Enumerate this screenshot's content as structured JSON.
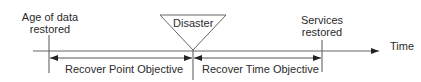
{
  "diagram": {
    "labels": {
      "age_of_data_restored": [
        "Age of data",
        "restored"
      ],
      "disaster": "Disaster",
      "services_restored": [
        "Services",
        "restored"
      ],
      "time": "Time"
    },
    "spans": {
      "rpo": "Recover Point Objective",
      "rto": "Recover Time Objective"
    },
    "colors": {
      "line": "#555555",
      "text": "#2b2b2b",
      "background": "#ffffff"
    }
  }
}
